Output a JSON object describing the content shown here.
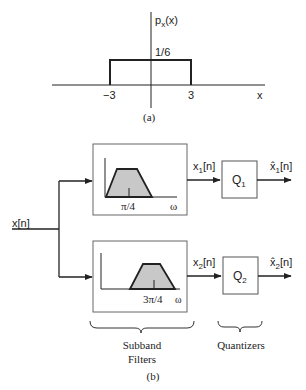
{
  "part_a": {
    "y_label": "p",
    "y_label_sub": "x",
    "y_label_arg": "(x)",
    "height_label": "1/6",
    "x_left_label": "−3",
    "x_right_label": "3",
    "x_axis_label": "x",
    "caption": "(a)"
  },
  "part_b": {
    "input_label": "x[n]",
    "filter1": {
      "center_label": "π/4",
      "axis_label": "ω"
    },
    "filter2": {
      "center_label": "3π/4",
      "axis_label": "ω"
    },
    "branch1": {
      "signal": "x",
      "signal_sub": "1",
      "signal_arg": "[n]",
      "quantizer": "Q",
      "quantizer_sub": "1",
      "output": "x̂",
      "output_sub": "1",
      "output_arg": "[n]"
    },
    "branch2": {
      "signal": "x",
      "signal_sub": "2",
      "signal_arg": "[n]",
      "quantizer": "Q",
      "quantizer_sub": "2",
      "output": "x̂",
      "output_sub": "2",
      "output_arg": "[n]"
    },
    "filters_caption_line1": "Subband",
    "filters_caption_line2": "Filters",
    "quantizers_caption": "Quantizers",
    "caption": "(b)"
  },
  "colors": {
    "line": "#222222",
    "box_border": "#555555",
    "passband_fill": "#c8c8c8"
  }
}
